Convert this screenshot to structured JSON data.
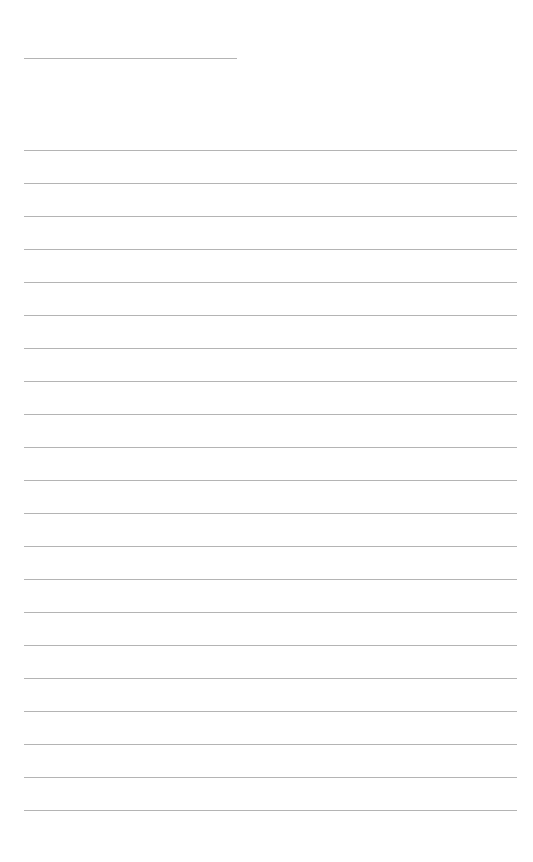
{
  "page": {
    "background": "#ffffff",
    "line_color": "#b4b4b4"
  },
  "header_line": {
    "top": 58,
    "left": 24,
    "width": 213
  },
  "ruled_lines": {
    "count": 21,
    "first_top": 150,
    "spacing": 33,
    "left": 24,
    "width": 493
  }
}
